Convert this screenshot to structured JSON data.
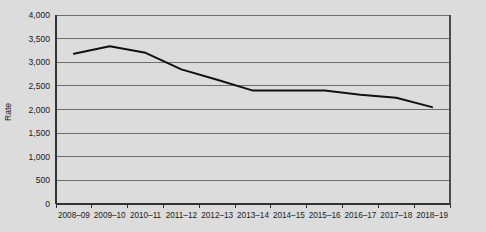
{
  "chart_data": {
    "type": "line",
    "title": "",
    "subtitle": "",
    "xlabel": "",
    "ylabel": "Rate",
    "categories": [
      "2008–09",
      "2009–10",
      "2010–11",
      "2011–12",
      "2012–13",
      "2013–14",
      "2014–15",
      "2015–16",
      "2016–17",
      "2017–18",
      "2018–19"
    ],
    "values": [
      3180,
      3340,
      3200,
      2850,
      2630,
      2400,
      2400,
      2400,
      2310,
      2250,
      2050
    ],
    "series": [
      {
        "name": "Rate",
        "values": [
          3180,
          3340,
          3200,
          2850,
          2630,
          2400,
          2400,
          2400,
          2310,
          2250,
          2050
        ],
        "color": "#111111"
      }
    ],
    "ylim": [
      0,
      4000
    ],
    "ytick_step": 500,
    "ytick_labels": [
      "0",
      "500",
      "1,000",
      "1,500",
      "2,000",
      "2,500",
      "3,000",
      "3,500",
      "4,000"
    ],
    "ytick_values": [
      0,
      500,
      1000,
      1500,
      2000,
      2500,
      3000,
      3500,
      4000
    ],
    "grid": true,
    "grid_axis": "y",
    "legend": false,
    "legend_position": "none",
    "background_color": "#dcdcdc",
    "gridline_color": "#6e6e6e",
    "line_color": "#111111"
  },
  "figure": {
    "plot_left": 56,
    "plot_right": 450,
    "plot_top": 15,
    "plot_bottom": 204
  }
}
